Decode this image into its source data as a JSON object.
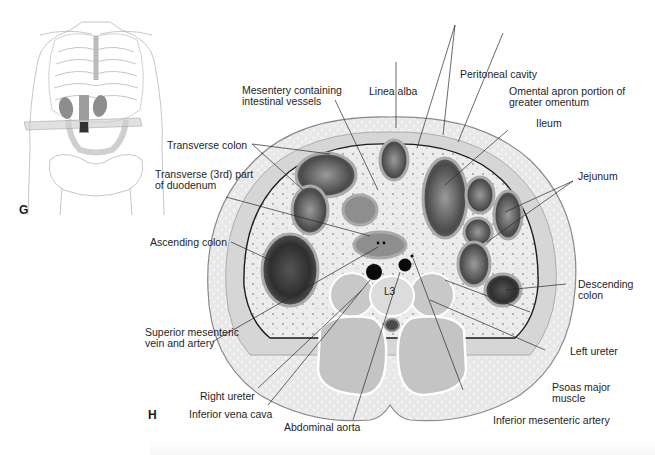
{
  "figure": {
    "panels": [
      {
        "letter": "G",
        "description": "Anterior view of torso showing transverse plane at L3 level"
      },
      {
        "letter": "H",
        "description": "Transverse section of abdomen at L3"
      }
    ],
    "vertebra_label": "L3",
    "labels": {
      "mesentery": [
        "Mesentery containing",
        "intestinal vessels"
      ],
      "linea_alba": "Linea alba",
      "peritoneal_cavity": "Peritoneal cavity",
      "omental_apron": [
        "Omental apron portion of",
        "greater omentum"
      ],
      "ileum": "Ileum",
      "transverse_colon": "Transverse colon",
      "duodenum": [
        "Transverse (3rd) part",
        "of duodenum"
      ],
      "jejunum": "Jejunum",
      "ascending_colon": "Ascending colon",
      "descending_colon": [
        "Descending",
        "colon"
      ],
      "sm_vein_artery": [
        "Superior mesenteric",
        "vein and artery"
      ],
      "left_ureter": "Left ureter",
      "right_ureter": "Right ureter",
      "psoas": [
        "Psoas major",
        "muscle"
      ],
      "ivc": "Inferior vena cava",
      "aorta": "Abdominal aorta",
      "ima": "Inferior mesenteric artery"
    },
    "colors": {
      "outline": "#8a8a8a",
      "skin_fat": "#e4e4e4",
      "muscle": "#c9c9c9",
      "bowel_dark": "#3a3a3a",
      "vessel": "#0a0a0a",
      "leader_line": "#2a2a2a"
    }
  }
}
